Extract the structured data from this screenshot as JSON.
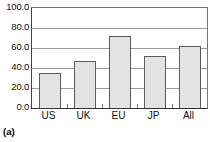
{
  "caption": "(a)",
  "chart_data": {
    "type": "bar",
    "title": "",
    "subtitle": "",
    "xlabel": "",
    "ylabel": "",
    "categories": [
      "US",
      "UK",
      "EU",
      "JP",
      "All"
    ],
    "values": [
      35.0,
      47.0,
      72.0,
      52.0,
      62.0
    ],
    "series": [
      {
        "name": "",
        "values": [
          35.0,
          47.0,
          72.0,
          52.0,
          62.0
        ]
      }
    ],
    "ylim": [
      0.0,
      100.0
    ],
    "ytick_values": [
      100.0,
      80.0,
      60.0,
      40.0,
      20.0,
      0.0
    ],
    "ytick_labels": [
      "100.0",
      "80.0",
      "60.0",
      "40.0",
      "20.0",
      "0.0"
    ],
    "grid": true,
    "grid_axis": "y",
    "legend": false,
    "legend_position": "none",
    "annotations": [],
    "colors": {
      "bar_fill": "#e3e3e3",
      "bar_border": "#5d5d5d",
      "gridline": "#9a9a9a",
      "axis": "#333333",
      "text": "#111111",
      "background": "#ffffff"
    }
  }
}
